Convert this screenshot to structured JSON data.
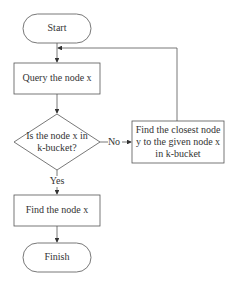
{
  "diagram": {
    "type": "flowchart",
    "nodes": {
      "start": {
        "label": "Start",
        "shape": "terminator"
      },
      "query": {
        "label": "Query the node x",
        "shape": "process"
      },
      "decision": {
        "line1": "Is the node x in",
        "line2": "k-bucket?",
        "shape": "decision"
      },
      "closest": {
        "line1": "Find the closest node",
        "line2": "y to the given node x",
        "line3": "in k-bucket",
        "shape": "process"
      },
      "found": {
        "label": "Find the node x",
        "shape": "process"
      },
      "finish": {
        "label": "Finish",
        "shape": "terminator"
      }
    },
    "edges": {
      "no": "No",
      "yes": "Yes"
    },
    "colors": {
      "stroke": "#555555",
      "text": "#333333",
      "background": "#ffffff"
    }
  }
}
